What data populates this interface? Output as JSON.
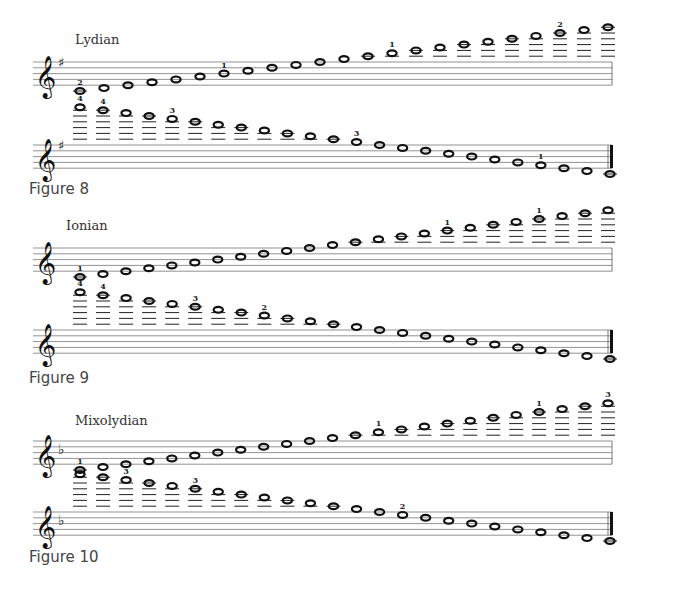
{
  "figures": [
    {
      "caption": "Figure 8",
      "mode": "Lydian",
      "key_signature": "sharp",
      "ascending": {
        "staff_top": 62,
        "steps": [
          -2,
          -1,
          0,
          1,
          2,
          3,
          4,
          5,
          6,
          7,
          8,
          9,
          10,
          11,
          12,
          13,
          14,
          15,
          16,
          17,
          18,
          19,
          20
        ],
        "fingerings": {
          "0": "2",
          "6": "1",
          "13": "1",
          "20": "2"
        }
      },
      "descending": {
        "staff_top": 145,
        "steps": [
          21,
          20,
          19,
          18,
          17,
          16,
          15,
          14,
          13,
          12,
          11,
          10,
          9,
          8,
          7,
          6,
          5,
          4,
          3,
          2,
          1,
          0,
          -1,
          -2
        ],
        "fingerings": {
          "0": "4",
          "1": "4",
          "4": "3",
          "12": "3",
          "20": "1"
        }
      },
      "caption_top": 180,
      "title_top": 32
    },
    {
      "caption": "Figure 9",
      "mode": "Ionian",
      "key_signature": "none",
      "ascending": {
        "staff_top": 248,
        "steps": [
          -2,
          -1,
          0,
          1,
          2,
          3,
          4,
          5,
          6,
          7,
          8,
          9,
          10,
          11,
          12,
          13,
          14,
          15,
          16,
          17,
          18,
          19,
          20,
          21
        ],
        "fingerings": {
          "0": "1",
          "16": "1",
          "20": "1"
        }
      },
      "descending": {
        "staff_top": 330,
        "steps": [
          21,
          20,
          19,
          18,
          17,
          16,
          15,
          14,
          13,
          12,
          11,
          10,
          9,
          8,
          7,
          6,
          5,
          4,
          3,
          2,
          1,
          0,
          -1,
          -2
        ],
        "fingerings": {
          "0": "4",
          "1": "4",
          "5": "3",
          "8": "2"
        }
      },
      "caption_top": 369,
      "title_top": 218
    },
    {
      "caption": "Figure 10",
      "mode": "Mixolydian",
      "key_signature": "flat",
      "ascending": {
        "staff_top": 441,
        "steps": [
          -2,
          -1,
          0,
          1,
          2,
          3,
          4,
          5,
          6,
          7,
          8,
          9,
          10,
          11,
          12,
          13,
          14,
          15,
          16,
          17,
          18,
          19,
          20,
          21
        ],
        "fingerings": {
          "0": "1",
          "13": "1",
          "20": "1",
          "23": "3"
        }
      },
      "descending": {
        "staff_top": 512,
        "steps": [
          21,
          20,
          19,
          18,
          17,
          16,
          15,
          14,
          13,
          12,
          11,
          10,
          9,
          8,
          7,
          6,
          5,
          4,
          3,
          2,
          1,
          0,
          -1,
          -2
        ],
        "fingerings": {
          "2": "3",
          "5": "3",
          "14": "2"
        }
      },
      "caption_top": 548,
      "title_top": 413
    }
  ]
}
